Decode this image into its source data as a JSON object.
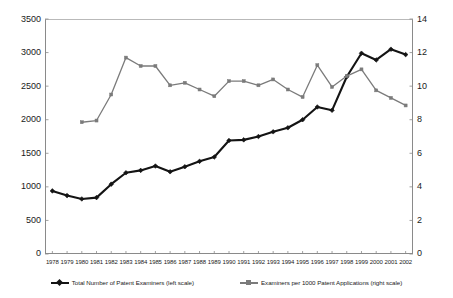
{
  "chart_data": {
    "type": "line",
    "title": "",
    "xlabel": "",
    "ylabel": "",
    "ylabel_right": "",
    "grid": false,
    "legend_position": "bottom",
    "categories": [
      "1978",
      "1979",
      "1980",
      "1981",
      "1982",
      "1983",
      "1984",
      "1985",
      "1986",
      "1987",
      "1988",
      "1989",
      "1990",
      "1991",
      "1992",
      "1993",
      "1994",
      "1995",
      "1996",
      "1997",
      "1998",
      "1999",
      "2000",
      "2001",
      "2002"
    ],
    "yticks_left": [
      0,
      500,
      1000,
      1500,
      2000,
      2500,
      3000,
      3500
    ],
    "yticks_right": [
      0,
      2,
      4,
      6,
      8,
      10,
      12,
      14
    ],
    "ylim": [
      0,
      3500
    ],
    "ylim_right": [
      0,
      14
    ],
    "series": [
      {
        "name": "Total Number of Patent Examiners (left scale)",
        "axis": "left",
        "color": "#141414",
        "marker": "diamond",
        "values": [
          940,
          870,
          820,
          840,
          1040,
          1210,
          1245,
          1310,
          1225,
          1300,
          1380,
          1445,
          1690,
          1700,
          1750,
          1820,
          1880,
          2000,
          2190,
          2140,
          2640,
          2990,
          2890,
          3050,
          2970
        ]
      },
      {
        "name": "Examiners per 1000 Patent Applications (right scale)",
        "axis": "right",
        "color": "#7b7b7b",
        "marker": "square",
        "values": [
          null,
          null,
          7.85,
          7.95,
          9.5,
          11.7,
          11.2,
          11.2,
          10.05,
          10.2,
          9.8,
          9.4,
          10.3,
          10.3,
          10.05,
          10.4,
          9.8,
          9.35,
          11.25,
          9.95,
          10.6,
          11.0,
          9.75,
          9.3,
          8.85
        ]
      }
    ]
  },
  "axes": {
    "left_labels": [
      "3500",
      "3000",
      "2500",
      "2000",
      "1500",
      "1000",
      "500",
      "0"
    ],
    "right_labels": [
      "14",
      "12",
      "10",
      "8",
      "6",
      "4",
      "2",
      "0"
    ]
  },
  "legend": {
    "items": [
      {
        "label": "Total Number of Patent Examiners (left scale)"
      },
      {
        "label": "Examiners per 1000 Patent Applications (right scale)"
      }
    ]
  },
  "colors": {
    "series_a": "#141414",
    "series_b": "#7b7b7b",
    "axis": "#8a8a8a",
    "background": "#ffffff"
  }
}
